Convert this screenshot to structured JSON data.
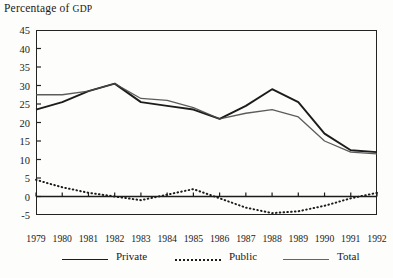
{
  "chart_data": {
    "type": "line",
    "title": "Percentage of GDP",
    "xlabel": "",
    "ylabel": "Percentage of GDP",
    "grid": false,
    "legend_position": "bottom",
    "ylim": [
      -5,
      45
    ],
    "ytick_step": 5,
    "yticks": [
      45,
      40,
      35,
      30,
      25,
      20,
      15,
      10,
      5,
      0,
      -5
    ],
    "categories": [
      "1979",
      "1980",
      "1981",
      "1982",
      "1983",
      "1984",
      "1985",
      "1986",
      "1987",
      "1988",
      "1989",
      "1990",
      "1991",
      "1992"
    ],
    "x": [
      "1979",
      "1980",
      "1981",
      "1982",
      "1983",
      "1984",
      "1985",
      "1986",
      "1987",
      "1988",
      "1989",
      "1990",
      "1991",
      "1992"
    ],
    "series": [
      {
        "name": "Private",
        "style": "solid",
        "color": "#1c1c1c",
        "values": [
          23.5,
          25.5,
          28.5,
          30.5,
          25.5,
          24.5,
          23.5,
          21.0,
          24.5,
          29.0,
          25.5,
          17.0,
          12.5,
          12.0
        ]
      },
      {
        "name": "Public",
        "style": "dotted",
        "color": "#1c1c1c",
        "values": [
          4.5,
          2.5,
          1.0,
          0.0,
          -1.0,
          0.5,
          2.0,
          -0.5,
          -3.0,
          -4.5,
          -4.0,
          -2.5,
          -0.5,
          1.0
        ]
      },
      {
        "name": "Total",
        "style": "fine",
        "color": "#4a4a4a",
        "values": [
          27.5,
          27.5,
          28.5,
          30.5,
          26.5,
          26.0,
          24.0,
          21.0,
          22.5,
          23.5,
          21.5,
          15.0,
          12.0,
          11.5
        ]
      }
    ]
  },
  "legend": {
    "items": [
      {
        "label": "Private",
        "style": "solid"
      },
      {
        "label": "Public",
        "style": "dotted"
      },
      {
        "label": "Total",
        "style": "fine"
      }
    ]
  },
  "title_parts": {
    "lead": "Percentage of ",
    "smallcaps": "GDP"
  },
  "colors": {
    "ink": "#1c1c1c",
    "ink_light": "#4a4a4a",
    "paper": "#fdfdfb"
  }
}
